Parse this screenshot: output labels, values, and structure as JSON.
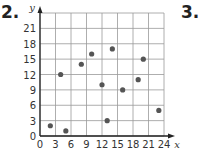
{
  "labels": {
    "left": "2.",
    "right": "3."
  },
  "chart_data": {
    "type": "scatter",
    "title": "",
    "xlabel": "x",
    "ylabel": "y",
    "xlim": [
      0,
      24
    ],
    "ylim": [
      0,
      24
    ],
    "xticks": [
      0,
      3,
      6,
      9,
      12,
      15,
      18,
      21,
      24
    ],
    "yticks": [
      0,
      3,
      6,
      9,
      12,
      15,
      18,
      21
    ],
    "grid": true,
    "points": [
      {
        "x": 2,
        "y": 2
      },
      {
        "x": 4,
        "y": 12
      },
      {
        "x": 5,
        "y": 1
      },
      {
        "x": 8,
        "y": 14
      },
      {
        "x": 10,
        "y": 16
      },
      {
        "x": 12,
        "y": 10
      },
      {
        "x": 13,
        "y": 3
      },
      {
        "x": 14,
        "y": 17
      },
      {
        "x": 16,
        "y": 9
      },
      {
        "x": 19,
        "y": 11
      },
      {
        "x": 20,
        "y": 15
      },
      {
        "x": 23,
        "y": 5
      }
    ],
    "colors": {
      "point": "#555555",
      "grid": "#999999",
      "axis": "#222222"
    }
  }
}
